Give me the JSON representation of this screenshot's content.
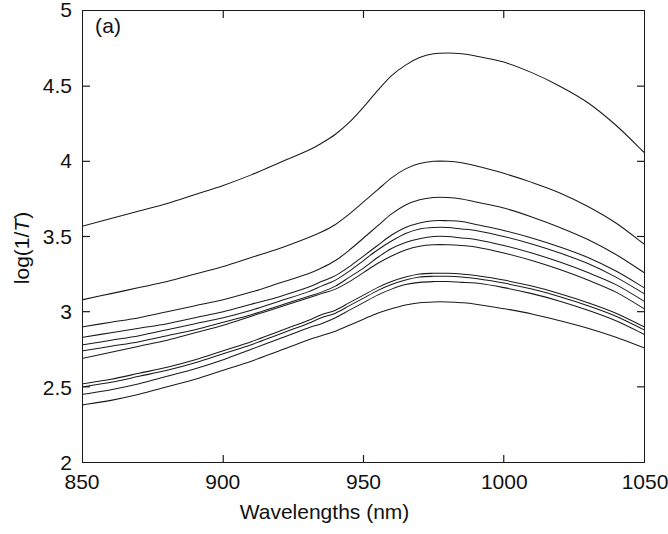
{
  "figure": {
    "panel_label": "(a)",
    "background_color": "#ffffff",
    "line_color": "#1a1a1a",
    "axis_color": "#1a1a1a"
  },
  "chart_data": {
    "type": "line",
    "title": "",
    "subtitle": "",
    "panel": "(a)",
    "xlabel": "Wavelengths (nm)",
    "ylabel": "log(1/T)",
    "xlim": [
      850,
      1050
    ],
    "ylim": [
      2,
      5
    ],
    "xticks": [
      850,
      900,
      950,
      1000,
      1050
    ],
    "yticks": [
      2,
      2.5,
      3,
      3.5,
      4,
      4.5,
      5
    ],
    "xtick_labels": [
      "850",
      "900",
      "950",
      "1000",
      "1050"
    ],
    "ytick_labels": [
      "2",
      "2.5",
      "3",
      "3.5",
      "4",
      "4.5",
      "5"
    ],
    "grid": false,
    "legend": null,
    "annotations": [
      {
        "text": "(a)",
        "x": 857,
        "y": 4.87
      }
    ],
    "x": [
      850,
      860,
      870,
      880,
      890,
      900,
      910,
      920,
      930,
      935,
      940,
      945,
      950,
      955,
      960,
      965,
      970,
      975,
      980,
      985,
      990,
      1000,
      1010,
      1020,
      1030,
      1040,
      1050
    ],
    "series": [
      {
        "name": "spectrum-1",
        "values": [
          3.57,
          3.62,
          3.67,
          3.72,
          3.78,
          3.84,
          3.91,
          3.99,
          4.07,
          4.12,
          4.18,
          4.26,
          4.36,
          4.47,
          4.57,
          4.64,
          4.69,
          4.715,
          4.72,
          4.715,
          4.7,
          4.66,
          4.59,
          4.5,
          4.39,
          4.24,
          4.06
        ]
      },
      {
        "name": "spectrum-2",
        "values": [
          3.08,
          3.12,
          3.16,
          3.2,
          3.25,
          3.3,
          3.36,
          3.42,
          3.49,
          3.53,
          3.58,
          3.65,
          3.73,
          3.81,
          3.89,
          3.95,
          3.985,
          4.0,
          4.0,
          3.99,
          3.97,
          3.92,
          3.86,
          3.79,
          3.7,
          3.59,
          3.45
        ]
      },
      {
        "name": "spectrum-3",
        "values": [
          2.9,
          2.93,
          2.96,
          3.0,
          3.04,
          3.08,
          3.13,
          3.19,
          3.25,
          3.29,
          3.34,
          3.41,
          3.49,
          3.57,
          3.65,
          3.71,
          3.745,
          3.76,
          3.76,
          3.75,
          3.73,
          3.69,
          3.63,
          3.56,
          3.48,
          3.38,
          3.26
        ]
      },
      {
        "name": "spectrum-4",
        "values": [
          2.83,
          2.86,
          2.89,
          2.92,
          2.96,
          3.0,
          3.05,
          3.1,
          3.16,
          3.2,
          3.24,
          3.3,
          3.37,
          3.44,
          3.51,
          3.56,
          3.59,
          3.605,
          3.605,
          3.6,
          3.58,
          3.54,
          3.49,
          3.43,
          3.36,
          3.27,
          3.16
        ]
      },
      {
        "name": "spectrum-5",
        "values": [
          2.78,
          2.81,
          2.84,
          2.88,
          2.92,
          2.96,
          3.01,
          3.07,
          3.13,
          3.17,
          3.21,
          3.27,
          3.34,
          3.41,
          3.47,
          3.52,
          3.55,
          3.56,
          3.56,
          3.55,
          3.54,
          3.5,
          3.45,
          3.39,
          3.32,
          3.23,
          3.12
        ]
      },
      {
        "name": "spectrum-6",
        "values": [
          2.74,
          2.77,
          2.8,
          2.84,
          2.88,
          2.93,
          2.98,
          3.04,
          3.1,
          3.13,
          3.17,
          3.23,
          3.29,
          3.36,
          3.42,
          3.46,
          3.485,
          3.5,
          3.5,
          3.49,
          3.48,
          3.44,
          3.39,
          3.33,
          3.26,
          3.18,
          3.07
        ]
      },
      {
        "name": "spectrum-7",
        "values": [
          2.69,
          2.73,
          2.77,
          2.81,
          2.86,
          2.91,
          2.97,
          3.03,
          3.09,
          3.12,
          3.15,
          3.2,
          3.26,
          3.32,
          3.37,
          3.41,
          3.435,
          3.445,
          3.445,
          3.44,
          3.43,
          3.39,
          3.34,
          3.28,
          3.21,
          3.13,
          3.02
        ]
      },
      {
        "name": "spectrum-8",
        "values": [
          2.52,
          2.55,
          2.59,
          2.63,
          2.68,
          2.74,
          2.8,
          2.87,
          2.94,
          2.98,
          3.01,
          3.06,
          3.11,
          3.16,
          3.2,
          3.23,
          3.25,
          3.255,
          3.255,
          3.25,
          3.24,
          3.21,
          3.17,
          3.12,
          3.06,
          2.99,
          2.9
        ]
      },
      {
        "name": "spectrum-9",
        "values": [
          2.5,
          2.53,
          2.57,
          2.61,
          2.66,
          2.72,
          2.78,
          2.85,
          2.92,
          2.96,
          2.99,
          3.04,
          3.09,
          3.14,
          3.18,
          3.21,
          3.23,
          3.235,
          3.235,
          3.23,
          3.22,
          3.19,
          3.15,
          3.1,
          3.04,
          2.97,
          2.88
        ]
      },
      {
        "name": "spectrum-10",
        "values": [
          2.45,
          2.48,
          2.52,
          2.57,
          2.62,
          2.68,
          2.75,
          2.82,
          2.89,
          2.92,
          2.96,
          3.01,
          3.06,
          3.11,
          3.15,
          3.18,
          3.195,
          3.2,
          3.2,
          3.195,
          3.19,
          3.16,
          3.12,
          3.07,
          3.01,
          2.94,
          2.85
        ]
      },
      {
        "name": "spectrum-11",
        "values": [
          2.38,
          2.41,
          2.45,
          2.5,
          2.55,
          2.61,
          2.67,
          2.74,
          2.81,
          2.84,
          2.87,
          2.91,
          2.95,
          2.99,
          3.02,
          3.045,
          3.06,
          3.065,
          3.065,
          3.06,
          3.05,
          3.02,
          2.985,
          2.94,
          2.89,
          2.83,
          2.76
        ]
      }
    ]
  }
}
